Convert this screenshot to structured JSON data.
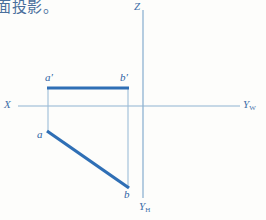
{
  "caption": {
    "text": "面投影。"
  },
  "colors": {
    "axis": "#8fb3d1",
    "object_line": "#2f6fb5",
    "projector_line": "#9dbdd8",
    "label": "#3f6fa8",
    "caption": "#4a6f9c",
    "background": "#fdfdfb"
  },
  "axes": {
    "z_label": "Z",
    "x_label": "X",
    "yw_label": "Y",
    "yw_sub": "W",
    "yh_label": "Y",
    "yh_sub": "H",
    "origin": {
      "x": 143,
      "y": 106
    },
    "x_axis": {
      "x1": 18,
      "y1": 106,
      "x2": 240,
      "y2": 106
    },
    "z_axis": {
      "x1": 143,
      "y1": 10,
      "x2": 143,
      "y2": 198
    }
  },
  "points": [
    {
      "name": "a-prime",
      "label": "a′",
      "x": 48,
      "y": 88,
      "projection": "frontal"
    },
    {
      "name": "b-prime",
      "label": "b′",
      "x": 128,
      "y": 88,
      "projection": "frontal"
    },
    {
      "name": "a",
      "label": "a",
      "x": 48,
      "y": 132,
      "projection": "horizontal"
    },
    {
      "name": "b",
      "label": "b",
      "x": 128,
      "y": 188,
      "projection": "horizontal"
    }
  ],
  "segments": [
    {
      "name": "frontal-projection-ab",
      "from": "a-prime",
      "to": "b-prime",
      "x1": 48,
      "y1": 88,
      "x2": 128,
      "y2": 88,
      "weight": 3.2,
      "style": "solid"
    },
    {
      "name": "horizontal-projection-ab",
      "from": "a",
      "to": "b",
      "x1": 48,
      "y1": 132,
      "x2": 128,
      "y2": 188,
      "weight": 3.2,
      "style": "solid"
    },
    {
      "name": "projector-left",
      "from": "a-prime",
      "to": "a",
      "x1": 48,
      "y1": 88,
      "x2": 48,
      "y2": 132,
      "weight": 1.0,
      "style": "solid"
    },
    {
      "name": "projector-right",
      "from": "b-prime",
      "to": "b",
      "x1": 128,
      "y1": 88,
      "x2": 128,
      "y2": 188,
      "weight": 1.0,
      "style": "solid"
    }
  ]
}
